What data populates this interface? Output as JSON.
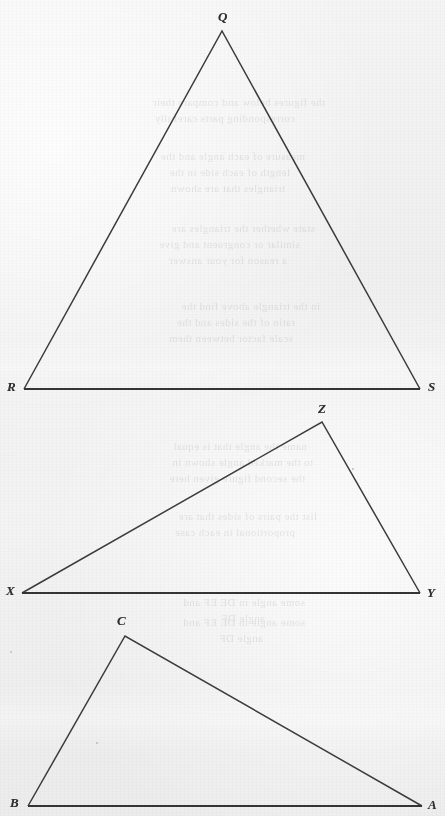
{
  "page": {
    "kind": "scanned-textbook-figure-page",
    "width": 445,
    "height": 816,
    "paper_color": "#f2f2f2",
    "ink_color": "#3b3b3b"
  },
  "figures": [
    {
      "id": "figure-qrs",
      "name": "triangle-qrs",
      "shape": "triangle",
      "description": "Tall isosceles triangle with apex at top",
      "vertices": [
        {
          "label": "Q",
          "x": 222,
          "y": 31,
          "label_x": 218,
          "label_y": 10
        },
        {
          "label": "R",
          "x": 24,
          "y": 389,
          "label_x": 7,
          "label_y": 380
        },
        {
          "label": "S",
          "x": 420,
          "y": 389,
          "label_x": 428,
          "label_y": 380
        }
      ],
      "base_edge": {
        "from": "R",
        "to": "S"
      }
    },
    {
      "id": "figure-xyz",
      "name": "triangle-xyz",
      "shape": "triangle",
      "description": "Obtuse scalene triangle with apex toward upper right",
      "vertices": [
        {
          "label": "Z",
          "x": 322,
          "y": 422,
          "label_x": 318,
          "label_y": 402
        },
        {
          "label": "X",
          "x": 22,
          "y": 593,
          "label_x": 6,
          "label_y": 584
        },
        {
          "label": "Y",
          "x": 420,
          "y": 593,
          "label_x": 427,
          "label_y": 586
        }
      ],
      "base_edge": {
        "from": "X",
        "to": "Y"
      }
    },
    {
      "id": "figure-abc",
      "name": "triangle-abc",
      "shape": "triangle",
      "description": "Obtuse scalene triangle with apex toward upper left",
      "vertices": [
        {
          "label": "C",
          "x": 125,
          "y": 636,
          "label_x": 117,
          "label_y": 614
        },
        {
          "label": "B",
          "x": 28,
          "y": 806,
          "label_x": 10,
          "label_y": 796
        },
        {
          "label": "A",
          "x": 422,
          "y": 806,
          "label_x": 428,
          "label_y": 798
        }
      ],
      "base_edge": {
        "from": "B",
        "to": "A"
      }
    }
  ],
  "showthrough_text": [
    {
      "text": "the figures below and compare their",
      "x": 120,
      "y": 96
    },
    {
      "text": "corresponding parts carefully",
      "x": 150,
      "y": 112
    },
    {
      "text": "measure of each angle and the",
      "x": 140,
      "y": 150
    },
    {
      "text": "length of each side in the",
      "x": 155,
      "y": 166
    },
    {
      "text": "triangles that are shown",
      "x": 160,
      "y": 182
    },
    {
      "text": "state whether the triangles are",
      "x": 130,
      "y": 222
    },
    {
      "text": "similar or congruent and give",
      "x": 145,
      "y": 238
    },
    {
      "text": "a reason for your answer",
      "x": 158,
      "y": 254
    },
    {
      "text": "in the triangle above find the",
      "x": 125,
      "y": 300
    },
    {
      "text": "ratio of the sides and the",
      "x": 150,
      "y": 316
    },
    {
      "text": "scale factor between them",
      "x": 152,
      "y": 332
    },
    {
      "text": "name the angle that is equal",
      "x": 138,
      "y": 440
    },
    {
      "text": "to the marked angle shown in",
      "x": 132,
      "y": 456
    },
    {
      "text": "the second figure given here",
      "x": 140,
      "y": 472
    },
    {
      "text": "list the pairs of sides that are",
      "x": 128,
      "y": 510
    },
    {
      "text": "proportional in each case",
      "x": 150,
      "y": 526
    },
    {
      "text": "some angle in DE  EF  and",
      "x": 140,
      "y": 596
    },
    {
      "text": "angle  DF",
      "x": 180,
      "y": 612
    },
    {
      "text": "some angle in DE  EF  and",
      "x": 140,
      "y": 616
    },
    {
      "text": "angle  DF",
      "x": 182,
      "y": 632
    }
  ]
}
